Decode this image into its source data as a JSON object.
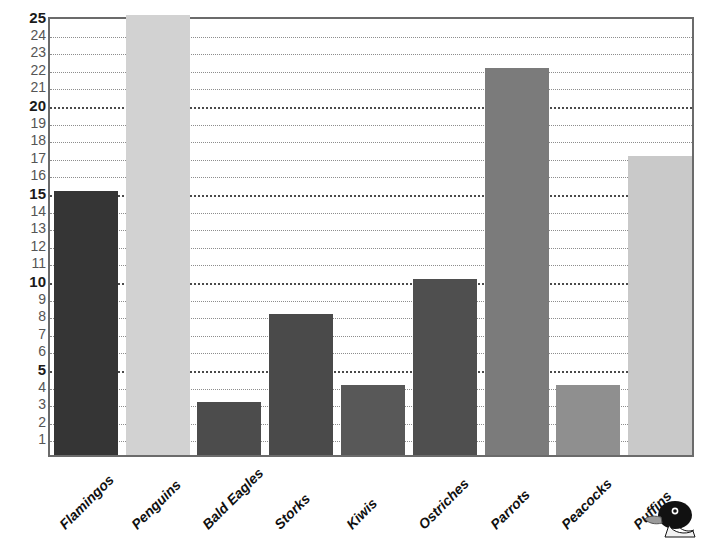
{
  "chart_data": {
    "type": "bar",
    "title": "",
    "subtitle": "",
    "xlabel": "",
    "ylabel": "",
    "ylim": [
      0,
      25
    ],
    "grid": true,
    "legend": false,
    "legend_position": "none",
    "categories": [
      "Flamingos",
      "Penguins",
      "Bald Eagles",
      "Storks",
      "Kiwis",
      "Ostriches",
      "Parrots",
      "Peacocks",
      "Puffins"
    ],
    "values": [
      15,
      25,
      3,
      8,
      4,
      10,
      22,
      4,
      17
    ],
    "bar_colors": [
      "#353535",
      "#d2d2d2",
      "#4c4c4c",
      "#4a4a4a",
      "#585858",
      "#4f4f4f",
      "#7b7b7b",
      "#8f8f8f",
      "#c9c9c9"
    ],
    "y_ticks": [
      {
        "value": 25,
        "label": "25",
        "major": true
      },
      {
        "value": 24,
        "label": "24",
        "major": false
      },
      {
        "value": 23,
        "label": "23",
        "major": false
      },
      {
        "value": 22,
        "label": "22",
        "major": false
      },
      {
        "value": 21,
        "label": "21",
        "major": false
      },
      {
        "value": 20,
        "label": "20",
        "major": true
      },
      {
        "value": 19,
        "label": "19",
        "major": false
      },
      {
        "value": 18,
        "label": "18",
        "major": false
      },
      {
        "value": 17,
        "label": "17",
        "major": false
      },
      {
        "value": 16,
        "label": "16",
        "major": false
      },
      {
        "value": 15,
        "label": "15",
        "major": true
      },
      {
        "value": 14,
        "label": "14",
        "major": false
      },
      {
        "value": 13,
        "label": "13",
        "major": false
      },
      {
        "value": 12,
        "label": "12",
        "major": false
      },
      {
        "value": 11,
        "label": "11",
        "major": false
      },
      {
        "value": 10,
        "label": "10",
        "major": true
      },
      {
        "value": 9,
        "label": "9",
        "major": false
      },
      {
        "value": 8,
        "label": "8",
        "major": false
      },
      {
        "value": 7,
        "label": "7",
        "major": false
      },
      {
        "value": 6,
        "label": "6",
        "major": false
      },
      {
        "value": 5,
        "label": "5",
        "major": true
      },
      {
        "value": 4,
        "label": "4",
        "major": false
      },
      {
        "value": 3,
        "label": "3",
        "major": false
      },
      {
        "value": 2,
        "label": "2",
        "major": false
      },
      {
        "value": 1,
        "label": "1",
        "major": false
      }
    ]
  },
  "decoration": {
    "bird_icon": "puffin-head-icon"
  },
  "colors": {
    "axis": "#6b6b6b",
    "gridline_minor": "#8d8d8d",
    "gridline_major": "#4a4a4a",
    "tick_text": "#555555",
    "tick_text_major": "#1a1a1a",
    "label_text": "#101010",
    "background": "#ffffff"
  }
}
